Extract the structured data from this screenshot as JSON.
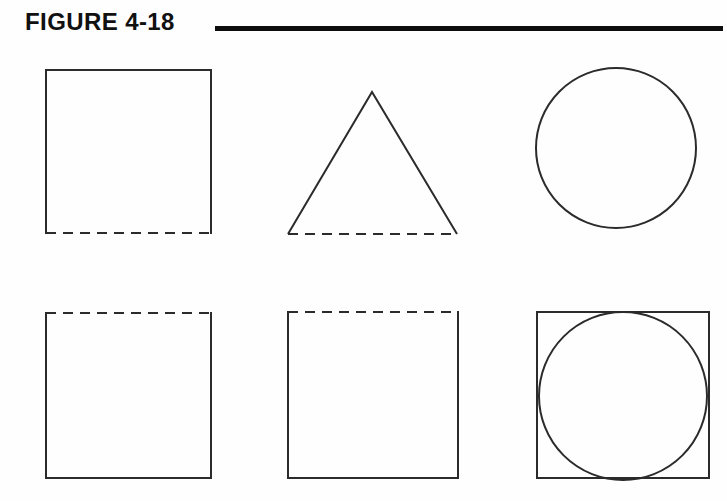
{
  "figure": {
    "title": "FIGURE 4-18",
    "rule_color": "#0d0d0d",
    "background_color": "#fefefe",
    "stroke_color": "#2b2b2b",
    "stroke_width": 2,
    "dash_pattern": "10 7",
    "rows": [
      {
        "row_label": "top-row",
        "shapes": [
          {
            "name": "square-dashed-bottom",
            "type": "square",
            "x": 46,
            "y": 18,
            "width": 165,
            "height": 163,
            "dashed_edge": "bottom",
            "description": "Square with solid top, left and right edges and a dashed bottom edge"
          },
          {
            "name": "triangle-dashed-base",
            "type": "triangle",
            "apex_x": 372,
            "apex_y": 40,
            "left_x": 288,
            "right_x": 457,
            "base_y": 182,
            "dashed_edge": "base",
            "description": "Isosceles triangle with solid slanted sides and a dashed base"
          },
          {
            "name": "circle-plain",
            "type": "circle",
            "cx": 616,
            "cy": 96,
            "r": 80,
            "dashed_edge": "none",
            "description": "Plain circle with a fully solid outline"
          }
        ]
      },
      {
        "row_label": "bottom-row",
        "shapes": [
          {
            "name": "square-dashed-top-left",
            "type": "square",
            "x": 46,
            "y": 261,
            "width": 165,
            "height": 165,
            "dashed_edge": "top",
            "description": "Square with a dashed top edge and solid left, right and bottom edges"
          },
          {
            "name": "square-dashed-top-middle",
            "type": "square",
            "x": 288,
            "y": 260,
            "width": 170,
            "height": 166,
            "dashed_edge": "top",
            "description": "Square with a dashed top edge and solid left, right and bottom edges"
          },
          {
            "name": "square-with-inscribed-circle",
            "type": "square-with-circle",
            "x": 537,
            "y": 260,
            "width": 172,
            "height": 166,
            "circle_cx": 623,
            "circle_cy": 344,
            "circle_r": 84,
            "dashed_edge": "none",
            "description": "Solid square containing a circle that touches the top and bottom edges and bulges slightly past the left and right sides"
          }
        ]
      }
    ]
  }
}
